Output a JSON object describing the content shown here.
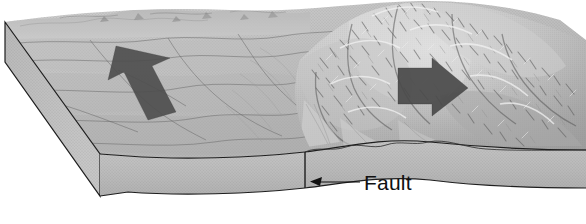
{
  "figure": {
    "kind": "geological-block-diagram",
    "background_color": "#ffffff"
  },
  "labels": {
    "fault": "Fault"
  },
  "annotations": [
    {
      "name": "fault-callout",
      "text": "Fault",
      "leader_from_x": 360,
      "leader_to_x": 311,
      "leader_y": 182,
      "arrow_direction": "left"
    }
  ],
  "motion_arrows": [
    {
      "name": "left-block-motion-arrow",
      "direction": "up-left",
      "color": "#4d4d4d",
      "center_x": 135,
      "center_y": 80
    },
    {
      "name": "right-block-motion-arrow",
      "direction": "down-right",
      "color": "#4a4a4a",
      "center_x": 437,
      "center_y": 90
    }
  ],
  "blocks": [
    {
      "name": "left-block",
      "surface": "low relief plain with drainage channels",
      "face_color": "#b4b4b4"
    },
    {
      "name": "right-block",
      "surface": "rugged mountain range with alluvial fans",
      "face_color": "#b0b0b0"
    }
  ],
  "colors": {
    "plain_light": "#c8c8c8",
    "plain_mid": "#b0b0b0",
    "plain_dark": "#949494",
    "mountain_light": "#e6e6e6",
    "mountain_mid": "#a6a6a6",
    "mountain_dark": "#6b6b6b",
    "side_face": "#bdbdbd",
    "front_face": "#b6b6b6",
    "outline": "#1e1e1e",
    "arrow_fill": "#4d4d4d",
    "label_text": "#111111"
  },
  "fault_line": {
    "name": "fault-trace",
    "x": 305,
    "top_y": 152,
    "bottom_y": 188
  }
}
